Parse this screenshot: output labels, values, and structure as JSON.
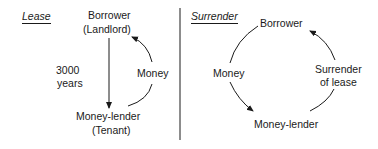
{
  "lease": {
    "title": "Lease",
    "borrower": "Borrower",
    "borrower_role": "(Landlord)",
    "duration_value": "3000",
    "duration_unit": "years",
    "money": "Money",
    "lender": "Money-lender",
    "lender_role": "(Tenant)"
  },
  "surrender": {
    "title": "Surrender",
    "borrower": "Borrower",
    "money": "Money",
    "surrender_line1": "Surrender",
    "surrender_line2": "of lease",
    "lender": "Money-lender"
  }
}
